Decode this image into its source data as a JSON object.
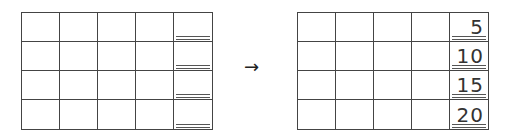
{
  "diagram": {
    "arrow": "→",
    "before": {
      "rows": 4,
      "cols": 5,
      "last_column_values": [
        "",
        "",
        "",
        ""
      ]
    },
    "after": {
      "rows": 4,
      "cols": 5,
      "last_column_values": [
        "5",
        "10",
        "15",
        "20"
      ]
    }
  }
}
